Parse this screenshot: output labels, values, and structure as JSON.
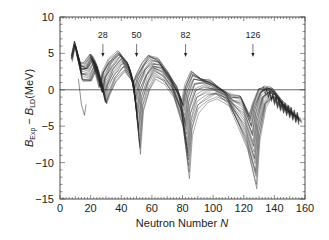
{
  "chart_data": {
    "type": "line",
    "title": "",
    "xlabel": "Neutron Number N",
    "xlabel_parts": {
      "text": "Neutron Number ",
      "italic": "N"
    },
    "ylabel": "B_Exp − B_LD(MeV)",
    "ylabel_parts": {
      "b1": "B",
      "sub1": "Exp",
      "minus": " − ",
      "b2": "B",
      "sub2": "LD",
      "unit": "(MeV)"
    },
    "xlim": [
      0,
      160
    ],
    "ylim": [
      -15,
      10
    ],
    "x_ticks": [
      0,
      20,
      40,
      60,
      80,
      100,
      120,
      140,
      160
    ],
    "y_ticks": [
      10,
      5,
      0,
      -5,
      -10,
      -15
    ],
    "y_tick_labels": [
      "10",
      "5",
      "0",
      "−5",
      "−10",
      "−15"
    ],
    "grid": false,
    "zero_line": true,
    "legend": null,
    "annotations": [
      {
        "label": "28",
        "x": 28,
        "arrow": true
      },
      {
        "label": "50",
        "x": 50,
        "arrow": true
      },
      {
        "label": "82",
        "x": 82,
        "arrow": true
      },
      {
        "label": "126",
        "x": 126,
        "arrow": true
      }
    ],
    "series_description": "Family of curves (one per proton number Z) of experimental minus liquid-drop binding energy vs neutron number; dips at magic numbers 28, 50, 82, 126",
    "envelope": {
      "x": [
        8,
        10,
        14,
        18,
        22,
        26,
        28,
        30,
        34,
        40,
        46,
        50,
        52,
        56,
        60,
        66,
        72,
        78,
        82,
        84,
        88,
        94,
        100,
        108,
        114,
        120,
        126,
        128,
        132,
        136,
        140,
        146,
        152,
        156
      ],
      "upper": [
        4.5,
        6.5,
        3.5,
        3.5,
        4.8,
        2.0,
        0.5,
        2.5,
        4.0,
        5.2,
        4.0,
        1.0,
        2.0,
        3.5,
        4.5,
        4.2,
        2.5,
        0.5,
        -1.5,
        0.5,
        2.5,
        1.8,
        1.2,
        0.0,
        -0.8,
        -1.0,
        -3.5,
        -2.0,
        0.0,
        0.3,
        0.2,
        -1.5,
        -2.5,
        -3.5
      ],
      "lower": [
        3.0,
        5.0,
        1.0,
        1.0,
        3.0,
        0.0,
        -2.2,
        -1.0,
        1.0,
        2.5,
        0.5,
        -9.0,
        -3.0,
        0.0,
        1.5,
        0.8,
        -1.0,
        -5.0,
        -12.0,
        -6.0,
        -3.0,
        -1.5,
        -1.0,
        -2.0,
        -5.0,
        -8.0,
        -13.5,
        -7.0,
        -2.5,
        -1.0,
        -1.5,
        -3.0,
        -4.0,
        -4.5
      ]
    },
    "outlier_series": {
      "name": "light Z branch",
      "x": [
        12,
        14,
        16,
        17
      ],
      "y": [
        1.5,
        -2.0,
        -3.5,
        -2.0
      ]
    },
    "series_count": 24,
    "line_color": "#222222"
  }
}
